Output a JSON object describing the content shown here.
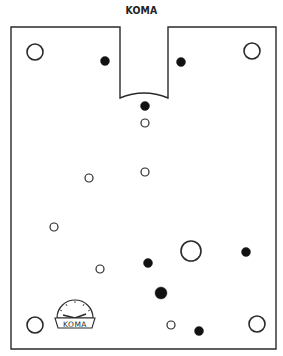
{
  "title": "KOMA",
  "colors": {
    "stroke": "#2a2a2a",
    "fill_dark": "#111111",
    "background": "#ffffff"
  },
  "board": {
    "outline": {
      "left": 11,
      "top": 27,
      "right": 276,
      "bottom": 349,
      "notch_left": 120,
      "notch_right": 168,
      "notch_bottom": 98,
      "notch_arc_peak": 94
    }
  },
  "holes": {
    "large_open": [
      {
        "cx": 35,
        "cy": 52,
        "r": 8
      },
      {
        "cx": 252,
        "cy": 51,
        "r": 8
      },
      {
        "cx": 191,
        "cy": 251,
        "r": 10
      },
      {
        "cx": 35,
        "cy": 325,
        "r": 8
      },
      {
        "cx": 257,
        "cy": 324,
        "r": 8
      }
    ],
    "small_open": [
      {
        "cx": 145,
        "cy": 123,
        "r": 4
      },
      {
        "cx": 145,
        "cy": 172,
        "r": 4
      },
      {
        "cx": 89,
        "cy": 178,
        "r": 4
      },
      {
        "cx": 54,
        "cy": 227,
        "r": 4
      },
      {
        "cx": 100,
        "cy": 269,
        "r": 4
      },
      {
        "cx": 171,
        "cy": 325,
        "r": 4
      }
    ],
    "filled": [
      {
        "cx": 105,
        "cy": 61,
        "r": 4.5
      },
      {
        "cx": 181,
        "cy": 62,
        "r": 4.5
      },
      {
        "cx": 145,
        "cy": 106,
        "r": 4.5
      },
      {
        "cx": 148,
        "cy": 263,
        "r": 4.5
      },
      {
        "cx": 246,
        "cy": 252,
        "r": 4.5
      },
      {
        "cx": 161,
        "cy": 293,
        "r": 6
      },
      {
        "cx": 199,
        "cy": 331,
        "r": 4.5
      }
    ]
  },
  "logo": {
    "text": "KOMA",
    "cx": 75,
    "cy": 316
  }
}
